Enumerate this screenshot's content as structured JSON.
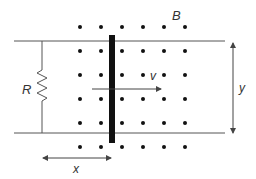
{
  "diagram": {
    "labels": {
      "field": "B",
      "resistor": "R",
      "velocity": "v",
      "rail_separation": "y",
      "displacement": "x"
    },
    "field_direction": "out-of-page (dots)",
    "dot_grid": {
      "columns": 6,
      "rows": 6
    },
    "colors": {
      "rail": "#555555",
      "bar": "#111111",
      "dot": "#111111",
      "arrow": "#444444",
      "text": "#333333"
    }
  }
}
